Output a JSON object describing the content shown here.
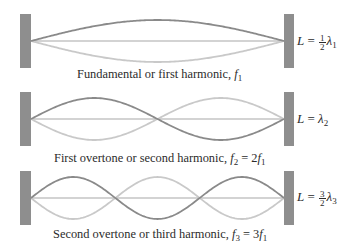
{
  "figure": {
    "colors": {
      "wall": "#8e8e8e",
      "wave_dark": "#8a8a8a",
      "wave_light": "#c9c9c9",
      "axis": "#c4c4c4",
      "text": "#2b2b2b"
    },
    "panels": [
      {
        "harmonic": 1,
        "caption": {
          "text": "Fundamental or first harmonic, ",
          "var": "f",
          "var_sub": "1",
          "rhs": ""
        },
        "length_relation": {
          "lhs": "L",
          "coef_num": "1",
          "coef_den": "2",
          "lambda": "λ",
          "lambda_sub": "1"
        }
      },
      {
        "harmonic": 2,
        "caption": {
          "text": "First overtone or second harmonic, ",
          "var": "f",
          "var_sub": "2",
          "eq": " = 2",
          "rhs_var": "f",
          "rhs_sub": "1"
        },
        "length_relation": {
          "lhs": "L",
          "lambda": "λ",
          "lambda_sub": "2"
        }
      },
      {
        "harmonic": 3,
        "caption": {
          "text": "Second overtone or third harmonic, ",
          "var": "f",
          "var_sub": "3",
          "eq": " = 3",
          "rhs_var": "f",
          "rhs_sub": "1"
        },
        "length_relation": {
          "lhs": "L",
          "coef_num": "3",
          "coef_den": "2",
          "lambda": "λ",
          "lambda_sub": "3"
        }
      }
    ],
    "equals_sign": "="
  }
}
